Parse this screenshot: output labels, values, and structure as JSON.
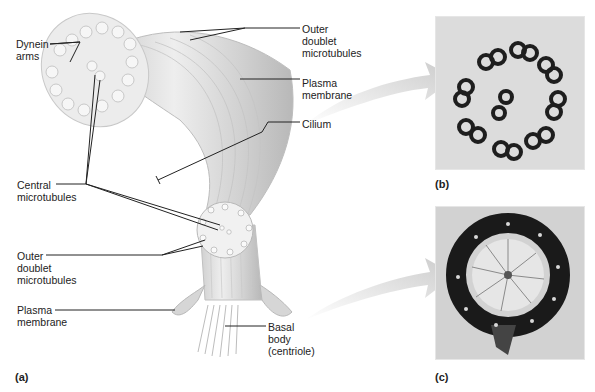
{
  "figure": {
    "panel_a": {
      "label": "(a)",
      "callouts": {
        "dynein_arms": "Dynein\narms",
        "outer_doublet_top": "Outer\ndoublet\nmicrotubules",
        "plasma_membrane_top": "Plasma\nmembrane",
        "cilium": "Cilium",
        "central_microtubules": "Central\nmicrotubules",
        "outer_doublet_bottom": "Outer\ndoublet\nmicrotubules",
        "plasma_membrane_bottom": "Plasma\nmembrane",
        "basal_body": "Basal\nbody\n(centriole)"
      }
    },
    "panel_b": {
      "label": "(b)",
      "description": "electron micrograph cross-section of cilium (9+2 arrangement)"
    },
    "panel_c": {
      "label": "(c)",
      "description": "electron micrograph cross-section of basal body (9 triplets, cartwheel)"
    },
    "colors": {
      "text": "#222222",
      "arrow": "#d0d0d0",
      "cilium_body": "#dcdcdc",
      "micrograph_bg": "#cfcfcf",
      "micrograph_dark": "#1e1e1e"
    }
  }
}
